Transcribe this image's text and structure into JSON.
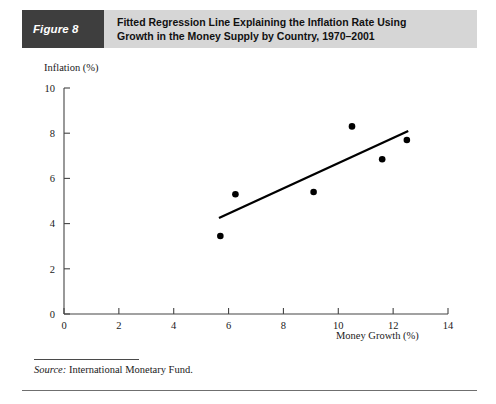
{
  "figure": {
    "number_label": "Figure 8",
    "title_lines": [
      "Fitted Regression Line Explaining the Inflation Rate Using",
      "Growth in the Money Supply by Country, 1970–2001"
    ],
    "source_label": "Source:",
    "source_text": " International Monetary Fund.",
    "banner_dark_color": "#3e3e3e",
    "banner_light_color": "#d6d6d6"
  },
  "chart_data": {
    "type": "scatter",
    "title": "Fitted Regression Line Explaining the Inflation Rate Using Growth in the Money Supply by Country, 1970–2001",
    "xlabel": "Money Growth (%)",
    "ylabel": "Inflation (%)",
    "xlim": [
      0,
      14
    ],
    "ylim": [
      0,
      10
    ],
    "xticks": [
      0,
      2,
      4,
      6,
      8,
      10,
      12,
      14
    ],
    "yticks": [
      0,
      2,
      4,
      6,
      8,
      10
    ],
    "xtick_labels": [
      "0",
      "2",
      "4",
      "6",
      "8",
      "10",
      "12",
      "14"
    ],
    "ytick_labels": [
      "0",
      "2",
      "4",
      "6",
      "8",
      "10"
    ],
    "grid": false,
    "legend": false,
    "marker_color": "#000000",
    "line_color": "#000000",
    "points": [
      {
        "x": 5.7,
        "y": 3.45
      },
      {
        "x": 6.25,
        "y": 5.3
      },
      {
        "x": 9.1,
        "y": 5.4
      },
      {
        "x": 10.5,
        "y": 8.3
      },
      {
        "x": 11.6,
        "y": 6.85
      },
      {
        "x": 12.5,
        "y": 7.7
      }
    ],
    "fit_line": {
      "name": "Fitted regression line",
      "x_start": 5.65,
      "y_start": 4.25,
      "x_end": 12.55,
      "y_end": 8.1
    }
  }
}
